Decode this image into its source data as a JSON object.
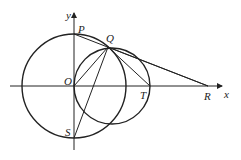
{
  "diagram": {
    "type": "geometry-figure",
    "axes": {
      "x_label": "x",
      "y_label": "y",
      "origin_label": "O"
    },
    "points": [
      {
        "name": "O",
        "label": "O",
        "x": 74,
        "y": 86
      },
      {
        "name": "P",
        "label": "P",
        "x": 74,
        "y": 34
      },
      {
        "name": "Q",
        "label": "Q",
        "x": 108,
        "y": 47
      },
      {
        "name": "R",
        "label": "R",
        "x": 208,
        "y": 86
      },
      {
        "name": "S",
        "label": "S",
        "x": 74,
        "y": 138
      },
      {
        "name": "T",
        "label": "T",
        "x": 150,
        "y": 86
      }
    ],
    "circles": [
      {
        "name": "circle-centered-O",
        "cx": 74,
        "cy": 86,
        "r": 52
      },
      {
        "name": "circle-through-O-Q-T",
        "cx": 112,
        "cy": 86,
        "r": 38
      }
    ],
    "segments": [
      [
        "P",
        "R"
      ],
      [
        "Q",
        "R"
      ],
      [
        "O",
        "Q"
      ],
      [
        "Q",
        "T"
      ],
      [
        "Q",
        "S"
      ]
    ]
  }
}
